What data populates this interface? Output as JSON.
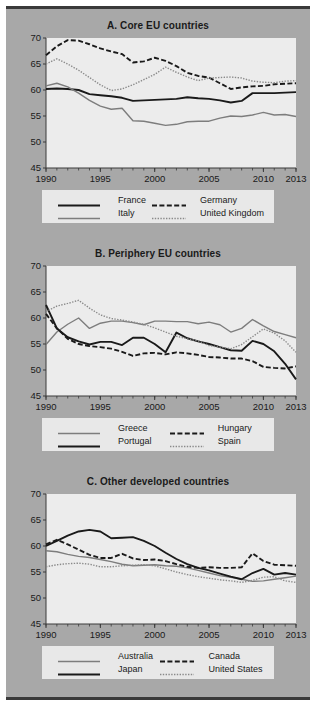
{
  "figure": {
    "background_color": "#a8a8a8",
    "plot_background_color": "#ececec",
    "legend_background_color": "#e8e8e8",
    "rule_color": "#3a3a3a"
  },
  "axis": {
    "y_ticks": [
      45,
      50,
      55,
      60,
      65,
      70
    ],
    "ylim": [
      45,
      70
    ],
    "x_ticks": [
      1990,
      1995,
      2000,
      2005,
      2010,
      2013
    ],
    "xlim": [
      1990,
      2013
    ],
    "x_tick_labels": [
      "1990",
      "1995",
      "2000",
      "2005",
      "2010",
      "2013"
    ],
    "y_tick_labels": [
      "45",
      "50",
      "55",
      "60",
      "65",
      "70"
    ]
  },
  "styles": {
    "solid_dark": {
      "color": "#1a1a1a",
      "width": 1.9,
      "dash": "none"
    },
    "solid_gray": {
      "color": "#7d7d7d",
      "width": 1.4,
      "dash": "none"
    },
    "dashed_dark": {
      "color": "#1a1a1a",
      "width": 1.9,
      "dash": "5,2.4"
    },
    "dotted_gray": {
      "color": "#8a8a8a",
      "width": 1.4,
      "dash": "1.4,1.4"
    }
  },
  "chart_data": [
    {
      "type": "line",
      "panel": "A",
      "title": "A. Core EU countries",
      "xlabel": "",
      "ylabel": "",
      "xlim": [
        1990,
        2013
      ],
      "ylim": [
        45,
        70
      ],
      "grid": false,
      "legend_position": "below",
      "x": [
        1990,
        1991,
        1992,
        1993,
        1994,
        1995,
        1996,
        1997,
        1998,
        1999,
        2000,
        2001,
        2002,
        2003,
        2004,
        2005,
        2006,
        2007,
        2008,
        2009,
        2010,
        2011,
        2012,
        2013
      ],
      "series": [
        {
          "name": "France",
          "style": "solid_dark",
          "values": [
            60.2,
            60.3,
            60.2,
            60.0,
            59.2,
            59.0,
            58.8,
            58.5,
            57.9,
            58.0,
            58.1,
            58.2,
            58.3,
            58.6,
            58.4,
            58.3,
            58.0,
            57.6,
            57.9,
            59.4,
            59.4,
            59.4,
            59.5,
            59.6
          ]
        },
        {
          "name": "Italy",
          "style": "solid_gray",
          "values": [
            60.8,
            61.3,
            60.6,
            59.4,
            58.0,
            56.9,
            56.3,
            56.5,
            54.1,
            54.0,
            53.6,
            53.2,
            53.4,
            53.9,
            54.0,
            54.0,
            54.6,
            55.0,
            54.9,
            55.2,
            55.7,
            55.2,
            55.3,
            54.9
          ]
        },
        {
          "name": "Germany",
          "style": "dashed_dark",
          "values": [
            66.7,
            68.4,
            69.6,
            69.5,
            68.8,
            68.0,
            67.4,
            66.9,
            65.3,
            65.5,
            66.2,
            65.6,
            64.6,
            63.3,
            62.7,
            62.4,
            61.3,
            60.2,
            60.5,
            60.7,
            60.8,
            61.1,
            61.2,
            61.3
          ]
        },
        {
          "name": "United Kingdom",
          "style": "dotted_gray",
          "values": [
            65.0,
            66.0,
            65.0,
            63.8,
            62.4,
            61.0,
            59.9,
            60.2,
            61.0,
            62.0,
            63.0,
            64.4,
            63.4,
            62.5,
            61.8,
            62.3,
            62.4,
            62.5,
            62.3,
            61.7,
            61.5,
            61.4,
            61.7,
            61.8
          ]
        }
      ]
    },
    {
      "type": "line",
      "panel": "B",
      "title": "B. Periphery EU countries",
      "xlabel": "",
      "ylabel": "",
      "xlim": [
        1990,
        2013
      ],
      "ylim": [
        45,
        70
      ],
      "grid": false,
      "legend_position": "below",
      "x": [
        1990,
        1991,
        1992,
        1993,
        1994,
        1995,
        1996,
        1997,
        1998,
        1999,
        2000,
        2001,
        2002,
        2003,
        2004,
        2005,
        2006,
        2007,
        2008,
        2009,
        2010,
        2011,
        2012,
        2013
      ],
      "series": [
        {
          "name": "Greece",
          "style": "solid_gray",
          "values": [
            54.9,
            57.3,
            58.8,
            60.0,
            58.0,
            59.0,
            59.4,
            59.4,
            59.1,
            58.7,
            59.4,
            59.4,
            59.3,
            59.3,
            58.9,
            59.2,
            58.7,
            57.3,
            58.0,
            59.7,
            58.5,
            57.4,
            56.8,
            56.2
          ]
        },
        {
          "name": "Portugal",
          "style": "solid_dark",
          "values": [
            62.5,
            58.0,
            56.3,
            55.5,
            54.9,
            55.4,
            55.4,
            54.8,
            56.2,
            56.2,
            55.0,
            53.4,
            57.2,
            56.1,
            55.5,
            55.0,
            54.4,
            53.8,
            53.7,
            55.6,
            55.0,
            53.6,
            51.2,
            48.2
          ]
        },
        {
          "name": "Hungary",
          "style": "dashed_dark",
          "values": [
            60.8,
            58.0,
            56.0,
            55.0,
            54.6,
            54.4,
            54.1,
            53.5,
            52.7,
            53.2,
            53.3,
            53.0,
            53.4,
            53.2,
            52.9,
            52.5,
            52.4,
            52.2,
            52.2,
            51.7,
            50.6,
            50.4,
            50.3,
            50.7
          ]
        },
        {
          "name": "Spain",
          "style": "dotted_gray",
          "values": [
            61.2,
            62.3,
            62.8,
            63.4,
            61.9,
            60.6,
            59.9,
            59.6,
            59.2,
            58.8,
            58.1,
            57.3,
            56.5,
            56.0,
            55.6,
            54.7,
            54.4,
            54.1,
            54.9,
            56.4,
            57.9,
            57.1,
            55.6,
            53.4
          ]
        }
      ]
    },
    {
      "type": "line",
      "panel": "C",
      "title": "C. Other developed countries",
      "xlabel": "",
      "ylabel": "",
      "xlim": [
        1990,
        2013
      ],
      "ylim": [
        45,
        70
      ],
      "grid": false,
      "legend_position": "below",
      "x": [
        1990,
        1991,
        1992,
        1993,
        1994,
        1995,
        1996,
        1997,
        1998,
        1999,
        2000,
        2001,
        2002,
        2003,
        2004,
        2005,
        2006,
        2007,
        2008,
        2009,
        2010,
        2011,
        2012,
        2013
      ],
      "series": [
        {
          "name": "Australia",
          "style": "solid_gray",
          "values": [
            59.1,
            58.9,
            58.4,
            58.0,
            57.8,
            57.4,
            57.0,
            56.5,
            56.2,
            56.3,
            56.4,
            56.2,
            56.1,
            55.8,
            55.3,
            54.8,
            54.3,
            54.0,
            53.6,
            53.2,
            53.3,
            53.6,
            53.9,
            54.2
          ]
        },
        {
          "name": "Japan",
          "style": "solid_dark",
          "values": [
            60.0,
            61.0,
            62.0,
            62.8,
            63.1,
            62.8,
            61.5,
            61.6,
            61.7,
            61.0,
            60.0,
            58.7,
            57.5,
            56.5,
            55.8,
            55.3,
            54.7,
            54.1,
            53.6,
            54.8,
            55.6,
            54.5,
            54.8,
            54.5
          ]
        },
        {
          "name": "Canada",
          "style": "dashed_dark",
          "values": [
            60.3,
            61.2,
            60.3,
            59.3,
            58.3,
            57.7,
            57.7,
            58.5,
            57.6,
            57.3,
            57.4,
            57.1,
            56.5,
            56.0,
            55.8,
            55.9,
            55.8,
            55.8,
            55.9,
            58.6,
            57.1,
            56.4,
            56.3,
            56.2
          ]
        },
        {
          "name": "United States",
          "style": "dotted_gray",
          "values": [
            56.0,
            56.4,
            56.6,
            56.7,
            56.5,
            56.0,
            56.0,
            56.2,
            56.3,
            56.4,
            56.2,
            55.6,
            55.0,
            54.5,
            54.1,
            53.8,
            53.5,
            53.3,
            53.0,
            53.4,
            54.0,
            54.1,
            53.3,
            53.0
          ]
        }
      ]
    }
  ],
  "legends": [
    {
      "panel": "A",
      "entries": [
        {
          "label": "France",
          "style": "solid_dark"
        },
        {
          "label": "Germany",
          "style": "dashed_dark"
        },
        {
          "label": "Italy",
          "style": "solid_gray"
        },
        {
          "label": "United Kingdom",
          "style": "dotted_gray"
        }
      ]
    },
    {
      "panel": "B",
      "entries": [
        {
          "label": "Greece",
          "style": "solid_gray"
        },
        {
          "label": "Hungary",
          "style": "dashed_dark"
        },
        {
          "label": "Portugal",
          "style": "solid_dark"
        },
        {
          "label": "Spain",
          "style": "dotted_gray"
        }
      ]
    },
    {
      "panel": "C",
      "entries": [
        {
          "label": "Australia",
          "style": "solid_gray"
        },
        {
          "label": "Canada",
          "style": "dashed_dark"
        },
        {
          "label": "Japan",
          "style": "solid_dark"
        },
        {
          "label": "United States",
          "style": "dotted_gray"
        }
      ]
    }
  ]
}
